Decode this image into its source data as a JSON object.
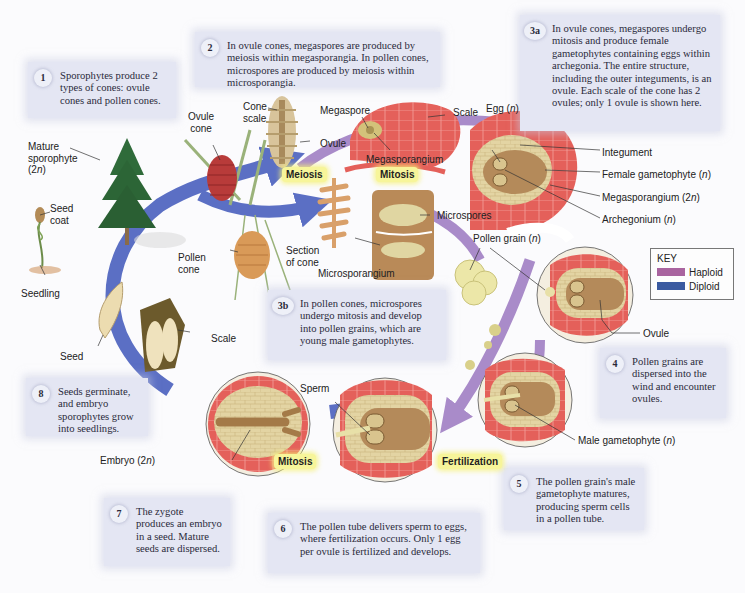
{
  "diagram": {
    "steps": [
      {
        "num": "1",
        "text": "Sporophytes produce 2 types of cones: ovule cones and pollen cones."
      },
      {
        "num": "2",
        "text": "In ovule cones, megaspores are produced by meiosis within megasporangia. In pollen cones, microspores are produced by meiosis within microsporangia."
      },
      {
        "num": "3a",
        "text": "In ovule cones, megaspores undergo mitosis and produce female gametophytes containing eggs within archegonia. The entire structure, including the outer integuments, is an ovule. Each scale of the cone has 2 ovules; only 1 ovule is shown here."
      },
      {
        "num": "3b",
        "text": "In pollen cones, microspores undergo mitosis and develop into pollen grains, which are young male gametophytes."
      },
      {
        "num": "4",
        "text": "Pollen grains are dispersed into the wind and encounter ovules."
      },
      {
        "num": "5",
        "text": "The pollen grain's male gametophyte matures, producing sperm cells in a pollen tube."
      },
      {
        "num": "6",
        "text": "The pollen tube delivers sperm to eggs, where fertilization occurs. Only 1 egg per ovule is fertilized and develops."
      },
      {
        "num": "7",
        "text": "The zygote produces an embryo in a seed. Mature seeds are dispersed."
      },
      {
        "num": "8",
        "text": "Seeds germinate, and embryo sporophytes grow into seedlings."
      }
    ],
    "processes": {
      "meiosis": "Meiosis",
      "mitosis_top": "Mitosis",
      "mitosis_bottom": "Mitosis",
      "fertilization": "Fertilization"
    },
    "labels": {
      "mature_sporophyte": "Mature sporophyte (2n)",
      "mature_sporophyte_l1": "Mature",
      "mature_sporophyte_l2": "sporophyte",
      "mature_sporophyte_l3": "(2",
      "ovule_cone_l1": "Ovule",
      "ovule_cone_l2": "cone",
      "cone_scale_l1": "Cone",
      "cone_scale_l2": "scale",
      "megaspore": "Megaspore",
      "ovule": "Ovule",
      "scale_top": "Scale",
      "megasporangium": "Megasporangium",
      "egg": "Egg (",
      "integument": "Integument",
      "female_gametophyte": "Female gametophyte (",
      "megasporangium_2n": "Megasporangium (2",
      "archegonium": "Archegonium (",
      "seed_coat_l1": "Seed",
      "seed_coat_l2": "coat",
      "seedling": "Seedling",
      "pollen_cone_l1": "Pollen",
      "pollen_cone_l2": "cone",
      "section_of_cone_l1": "Section",
      "section_of_cone_l2": "of cone",
      "microspores": "Microspores",
      "microsporangium": "Microsporangium",
      "pollen_grain": "Pollen grain (",
      "ovule_right": "Ovule",
      "seed": "Seed",
      "scale_bottom": "Scale",
      "sperm": "Sperm",
      "embryo": "Embryo (2",
      "male_gametophyte": "Male gametophyte (",
      "n": "n",
      "close_paren": ")"
    },
    "key": {
      "title": "KEY",
      "items": [
        {
          "label": "Haploid",
          "color": "#a9649f"
        },
        {
          "label": "Diploid",
          "color": "#3a5aa0"
        }
      ]
    },
    "colors": {
      "haploid_arrow": "#9b7bc0",
      "diploid_arrow": "#5b6fc4",
      "box_bg": "#e4e6f3",
      "process_highlight": "#f7f59a",
      "tissue_red": "#e0524f",
      "tissue_tan": "#d9c48e"
    }
  }
}
